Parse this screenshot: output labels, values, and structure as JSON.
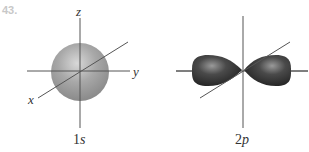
{
  "problem_number": "43.",
  "figures": [
    {
      "caption_prefix": "1",
      "caption_suffix": "s",
      "axes": {
        "z": "z",
        "y": "y",
        "x": "x"
      },
      "shape": "sphere"
    },
    {
      "caption_prefix": "2",
      "caption_suffix": "p",
      "shape": "dumbbell"
    }
  ],
  "colors": {
    "axis": "#555555",
    "sphere": "#9a9a9a",
    "lobe": "#3a3a3a",
    "number": "#c8c8c8"
  }
}
